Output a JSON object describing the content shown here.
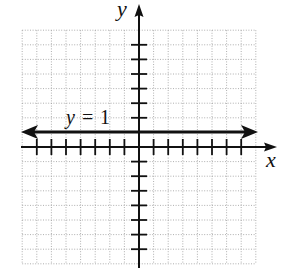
{
  "chart_data": {
    "type": "line",
    "title": "",
    "xlabel": "x",
    "ylabel": "y",
    "xlim": [
      -8,
      8
    ],
    "ylim": [
      -8,
      8
    ],
    "grid": true,
    "grid_style": "dotted",
    "tick_interval": 1,
    "series": [
      {
        "name": "y = 1",
        "equation": "y = 1",
        "kind": "horizontal line",
        "y": 1,
        "x": [
          -7.5,
          7.5
        ],
        "arrows_both_ends": true
      }
    ],
    "annotations": [
      {
        "text_var": "y",
        "text_eq": "=",
        "text_val": "1",
        "position": "above line, left of y-axis"
      }
    ]
  },
  "labels": {
    "x_axis": "x",
    "y_axis": "y",
    "line_var": "y",
    "line_eq": "=",
    "line_val": "1"
  },
  "colors": {
    "axis": "#111111",
    "line": "#111111",
    "grid": "#9a9a9a",
    "background": "#ffffff"
  }
}
